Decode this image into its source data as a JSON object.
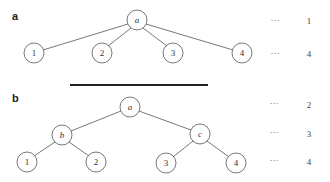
{
  "panels": [
    {
      "label": "a",
      "nodes": {
        "root": {
          "text": "a",
          "x": 137,
          "y": 20
        },
        "l1": {
          "text": "1",
          "x": 34,
          "y": 53
        },
        "l2": {
          "text": "2",
          "x": 102,
          "y": 53
        },
        "l3": {
          "text": "3",
          "x": 173,
          "y": 53
        },
        "l4": {
          "text": "4",
          "x": 242,
          "y": 53
        }
      },
      "levels": [
        {
          "dots": "···",
          "value": "1"
        },
        {
          "dots": "···",
          "value": "4"
        }
      ]
    },
    {
      "label": "b",
      "nodes": {
        "root": {
          "text": "a",
          "x": 130,
          "y": 107
        },
        "b": {
          "text": "b",
          "x": 62,
          "y": 135
        },
        "c": {
          "text": "c",
          "x": 200,
          "y": 134
        },
        "l1": {
          "text": "1",
          "x": 27,
          "y": 162
        },
        "l2": {
          "text": "2",
          "x": 96,
          "y": 162
        },
        "l3": {
          "text": "3",
          "x": 166,
          "y": 163
        },
        "l4": {
          "text": "4",
          "x": 236,
          "y": 163
        }
      },
      "levels": [
        {
          "dots": "···",
          "value": "2"
        },
        {
          "dots": "···",
          "value": "3"
        },
        {
          "dots": "···",
          "value": "4"
        }
      ]
    }
  ],
  "colors": {
    "stroke": "#555555",
    "separator": "#222222",
    "text": "#333333"
  }
}
